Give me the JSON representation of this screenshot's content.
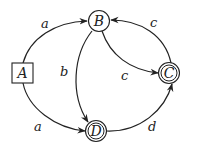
{
  "diagram": {
    "type": "state-machine",
    "nodes": [
      {
        "id": "A",
        "label": "A",
        "shape": "square",
        "accepting": false,
        "initial": true
      },
      {
        "id": "B",
        "label": "B",
        "shape": "circle",
        "accepting": false
      },
      {
        "id": "C",
        "label": "C",
        "shape": "double-circle",
        "accepting": true
      },
      {
        "id": "D",
        "label": "D",
        "shape": "double-circle",
        "accepting": true
      }
    ],
    "edges": [
      {
        "from": "A",
        "to": "B",
        "label": "a"
      },
      {
        "from": "A",
        "to": "D",
        "label": "a"
      },
      {
        "from": "B",
        "to": "D",
        "label": "b"
      },
      {
        "from": "B",
        "to": "C",
        "label": "c"
      },
      {
        "from": "C",
        "to": "B",
        "label": "c"
      },
      {
        "from": "D",
        "to": "C",
        "label": "d"
      }
    ]
  },
  "colors": {
    "stroke": "#222222",
    "background": "#ffffff"
  }
}
